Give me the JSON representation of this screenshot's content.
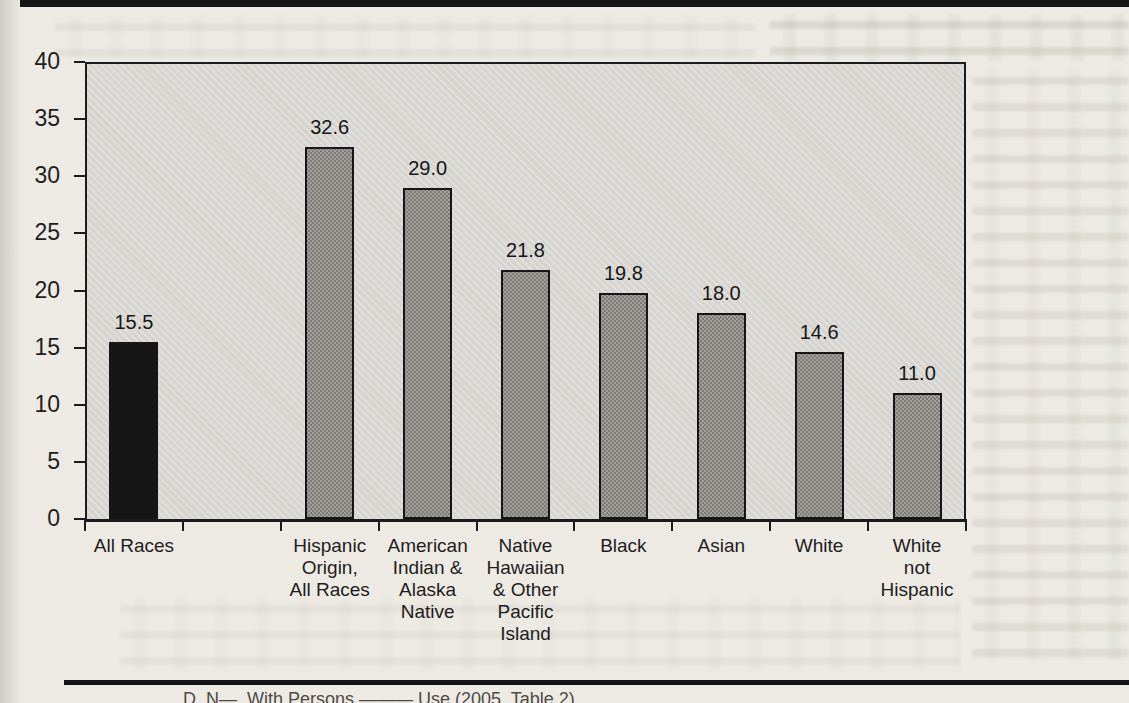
{
  "page": {
    "kind": "scanned book page figure",
    "caption_fragment": "D. N—,  With Persons ——— Use (2005, Table 2)"
  },
  "colors": {
    "page_bg": "#edeae4",
    "plot_bg": "#d6d4cf",
    "bar_gray_fill": "#a3a19c",
    "bar_gray_dot": "#7d7b76",
    "bar_black": "#161616",
    "line": "#1b1b1b"
  },
  "chart_data": {
    "type": "bar",
    "title": "",
    "xlabel": "",
    "ylabel": "",
    "categories": [
      "All Races",
      "Hispanic Origin, All Races",
      "American Indian & Alaska Native",
      "Native Hawaiian & Other Pacific Island",
      "Black",
      "Asian",
      "White",
      "White not Hispanic"
    ],
    "category_label_lines": [
      [
        "All Races"
      ],
      [
        "Hispanic",
        "Origin,",
        "All Races"
      ],
      [
        "American",
        "Indian &",
        "Alaska",
        "Native"
      ],
      [
        "Native",
        "Hawaiian",
        "& Other",
        "Pacific",
        "Island"
      ],
      [
        "Black"
      ],
      [
        "Asian"
      ],
      [
        "White"
      ],
      [
        "White",
        "not",
        "Hispanic"
      ]
    ],
    "values": [
      15.5,
      32.6,
      29.0,
      21.8,
      19.8,
      18.0,
      14.6,
      11.0
    ],
    "value_labels": [
      "15.5",
      "32.6",
      "29.0",
      "21.8",
      "19.8",
      "18.0",
      "14.6",
      "11.0"
    ],
    "bar_styles": [
      "solid-black",
      "dither-gray",
      "dither-gray",
      "dither-gray",
      "dither-gray",
      "dither-gray",
      "dither-gray",
      "dither-gray"
    ],
    "ylim": [
      0,
      40
    ],
    "yticks": [
      0,
      5,
      10,
      15,
      20,
      25,
      30,
      35,
      40
    ],
    "grid": false,
    "legend": "none",
    "slots": [
      0,
      2,
      3,
      4,
      5,
      6,
      7,
      8
    ],
    "total_slots": 9
  }
}
